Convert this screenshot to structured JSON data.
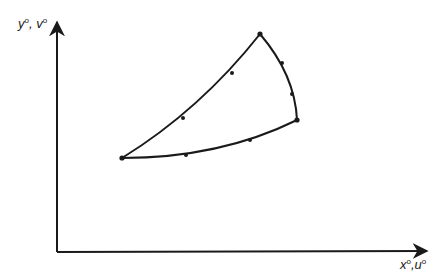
{
  "axes": {
    "y_label": {
      "var1": "y",
      "var2": "v",
      "sup": "o",
      "sep": ","
    },
    "x_label": {
      "var1": "x",
      "var2": "u",
      "sup": "o",
      "sep": ","
    }
  },
  "region": {
    "vertices": [
      {
        "name": "left",
        "x": 122,
        "y": 158
      },
      {
        "name": "top",
        "x": 260,
        "y": 34
      },
      {
        "name": "right",
        "x": 297,
        "y": 120
      }
    ],
    "markers": [
      {
        "x": 183,
        "y": 118
      },
      {
        "x": 232,
        "y": 73
      },
      {
        "x": 282,
        "y": 63
      },
      {
        "x": 292,
        "y": 94
      },
      {
        "x": 186,
        "y": 155
      },
      {
        "x": 250,
        "y": 140
      }
    ]
  },
  "colors": {
    "stroke": "#1a1a1a",
    "background": "#ffffff"
  }
}
